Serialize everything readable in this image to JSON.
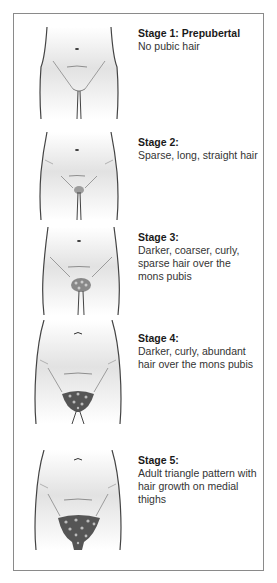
{
  "figure": {
    "stages": [
      {
        "title": "Stage 1: Prepubertal",
        "description": "No pubic hair",
        "hair_level": 0
      },
      {
        "title": "Stage 2:",
        "description": "Sparse, long, straight hair",
        "hair_level": 1
      },
      {
        "title": "Stage 3:",
        "description": "Darker, coarser, curly, sparse hair over the mons pubis",
        "hair_level": 2
      },
      {
        "title": "Stage 4:",
        "description": "Darker, curly, abundant hair over the mons pubis",
        "hair_level": 3
      },
      {
        "title": "Stage 5:",
        "description": "Adult triangle pattern with hair growth on medial thighs",
        "hair_level": 4
      }
    ]
  },
  "colors": {
    "border": "#8a8a8a",
    "outline": "#444444",
    "shade": "#d8d8d8",
    "hair": "#555555"
  }
}
